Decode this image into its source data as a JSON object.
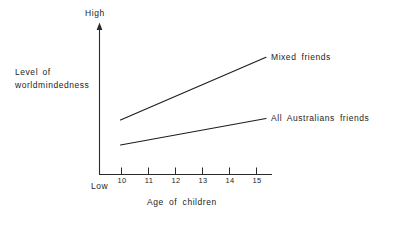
{
  "chart_data": {
    "type": "line",
    "title": "",
    "subtitle": "",
    "xlabel": "Age of children",
    "ylabel": "Level of worldmindedness",
    "ylabel_lines": [
      "Level of",
      "worldmindedness"
    ],
    "y_axis_top_label": "High",
    "y_axis_bottom_label": "Low",
    "grid": false,
    "legend_position": "right-inline-labels",
    "categories": [
      "10",
      "11",
      "12",
      "13",
      "14",
      "15"
    ],
    "x": [
      10,
      11,
      12,
      13,
      14,
      15
    ],
    "xlim": [
      10,
      15
    ],
    "ylim": [
      0,
      1
    ],
    "series": [
      {
        "name": "Mixed friends",
        "values": [
          0.37,
          0.455,
          0.54,
          0.625,
          0.71,
          0.795
        ],
        "color": "#1d1d1d"
      },
      {
        "name": "All Australians friends",
        "values": [
          0.2,
          0.236,
          0.272,
          0.308,
          0.344,
          0.38
        ],
        "color": "#1d1d1d"
      }
    ],
    "annotations": [
      {
        "text": "Mixed friends",
        "at_x": 15,
        "at_y": 0.795
      },
      {
        "text": "All Australians friends",
        "at_x": 15,
        "at_y": 0.38
      }
    ],
    "axis_color": "#2a2a2a"
  }
}
